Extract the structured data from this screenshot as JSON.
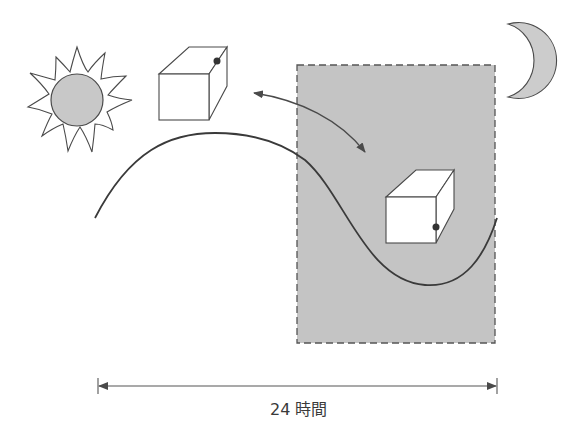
{
  "diagram": {
    "title": "",
    "duration_label": "24 時間",
    "colors": {
      "line": "#4a4a4a",
      "sun_fill": "#c8c8c8",
      "night_fill": "#c4c4c4",
      "moon_fill": "#cccccc",
      "cube_fill": "#ffffff",
      "dot": "#333333"
    },
    "elements": [
      {
        "name": "sun-icon",
        "meaning": "day"
      },
      {
        "name": "moon-icon",
        "meaning": "night"
      },
      {
        "name": "cube-day",
        "meaning": "object during day"
      },
      {
        "name": "cube-night",
        "meaning": "object during night"
      },
      {
        "name": "night-region",
        "meaning": "night period (shaded, dashed border)"
      },
      {
        "name": "daily-cycle-curve",
        "meaning": "sinusoidal 24-hour cycle"
      },
      {
        "name": "double-arrow",
        "meaning": "transition between day and night states"
      },
      {
        "name": "timeline-arrow",
        "meaning": "24-hour span"
      }
    ]
  }
}
